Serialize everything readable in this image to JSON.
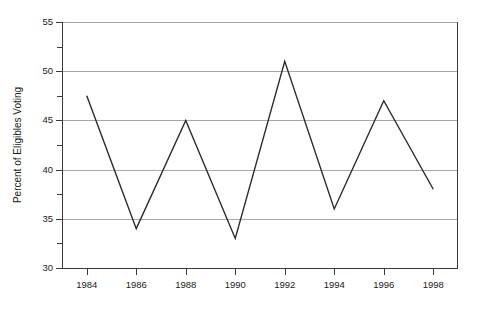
{
  "chart_data": {
    "type": "line",
    "title": "",
    "xlabel": "",
    "ylabel": "Percent of Eligibles Voting",
    "categories": [
      1984,
      1986,
      1988,
      1990,
      1992,
      1994,
      1996,
      1998
    ],
    "values": [
      47.5,
      34,
      45,
      33,
      51,
      36,
      47,
      38
    ],
    "series": [
      {
        "name": "Percent of Eligibles Voting",
        "values": [
          47.5,
          34,
          45,
          33,
          51,
          36,
          47,
          38
        ]
      }
    ],
    "x_tick_labels": [
      "1984",
      "1986",
      "1988",
      "1990",
      "1992",
      "1994",
      "1996",
      "1998"
    ],
    "y_tick_labels": [
      "30",
      "35",
      "40",
      "45",
      "50",
      "55"
    ],
    "y_major_ticks": [
      30,
      35,
      40,
      45,
      50,
      55
    ],
    "y_minor_ticks": [
      32.5,
      37.5,
      42.5,
      47.5,
      52.5
    ],
    "ylim": [
      30,
      55
    ],
    "xlim": [
      1983,
      1999
    ],
    "grid": "horizontal-major-only",
    "legend": "none",
    "line_color": "#2b2b2b",
    "grid_color": "#a8a8a8",
    "axis_color": "#3a3a3a",
    "background_color": "#ffffff",
    "markers": "none"
  }
}
